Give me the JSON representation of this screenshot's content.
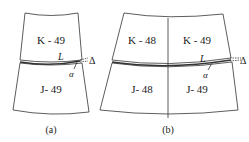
{
  "figure": {
    "panel_a": {
      "caption": "(a)",
      "top_label": "K - 49",
      "bottom_label": "J- 49",
      "seam_label": "L",
      "angle_label": "α",
      "gap_label": "Δ"
    },
    "panel_b": {
      "caption": "(b)",
      "top_left_label": "K - 48",
      "top_right_label": "K - 49",
      "bottom_left_label": "J- 48",
      "bottom_right_label": "J- 49",
      "seam_label": "L",
      "angle_label": "α",
      "gap_label": "Δ"
    },
    "colors": {
      "line": "#333333",
      "background": "#ffffff"
    }
  }
}
